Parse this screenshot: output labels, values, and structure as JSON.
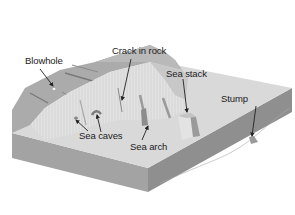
{
  "diagram": {
    "type": "coastal-erosion-landforms",
    "colors": {
      "background": "#ffffff",
      "land_top": "#a9a9a9",
      "land_top_light": "#b8b8b8",
      "cliff_face": "#dcdcdc",
      "wave_cut_platform": "#d6d6d6",
      "sea_bed_front": "#9c9c9c",
      "sea_bed_side": "#8a8a8a",
      "crack": "#777777",
      "arrow": "#222222",
      "text": "#222222"
    },
    "labels": [
      {
        "id": "blowhole",
        "text": "Blowhole"
      },
      {
        "id": "crack",
        "text": "Crack in rock"
      },
      {
        "id": "sea_stack",
        "text": "Sea stack"
      },
      {
        "id": "stump",
        "text": "Stump"
      },
      {
        "id": "sea_caves",
        "text": "Sea caves"
      },
      {
        "id": "sea_arch",
        "text": "Sea arch"
      }
    ]
  }
}
